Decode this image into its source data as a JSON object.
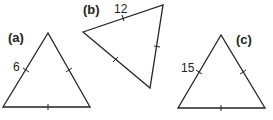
{
  "figure": {
    "triangles": [
      {
        "id": "a",
        "label": "(a)",
        "side_label": "6",
        "points": [
          [
            48,
            33
          ],
          [
            3,
            107
          ],
          [
            90,
            107
          ]
        ]
      },
      {
        "id": "b",
        "label": "(b)",
        "side_label": "12",
        "points": [
          [
            83,
            32
          ],
          [
            163,
            5
          ],
          [
            150,
            88
          ]
        ]
      },
      {
        "id": "c",
        "label": "(c)",
        "side_label": "15",
        "points": [
          [
            221,
            35
          ],
          [
            178,
            108
          ],
          [
            265,
            108
          ]
        ]
      }
    ],
    "stroke_color": "#222222"
  }
}
